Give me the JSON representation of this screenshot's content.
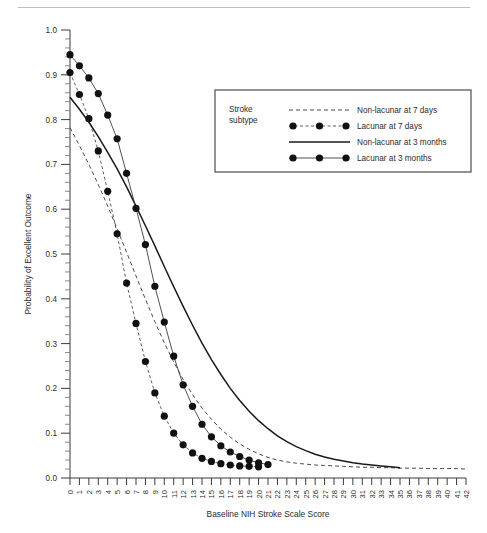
{
  "figure": {
    "background": "#ffffff",
    "rule_color": "#bdbdbd"
  },
  "chart_data": {
    "type": "line",
    "title": "",
    "xlabel": "Baseline NIH Stroke Scale Score",
    "ylabel": "Probability of Excellent Outcome",
    "xlim": [
      0,
      42
    ],
    "ylim": [
      0.0,
      1.0
    ],
    "grid": false,
    "x_tick_labels": [
      "0",
      "1",
      "2",
      "3",
      "4",
      "5",
      "6",
      "7",
      "8",
      "9",
      "10",
      "11",
      "12",
      "13",
      "14",
      "15",
      "16",
      "17",
      "18",
      "19",
      "20",
      "21",
      "22",
      "23",
      "24",
      "25",
      "26",
      "27",
      "28",
      "29",
      "30",
      "31",
      "32",
      "33",
      "34",
      "35",
      "36",
      "37",
      "38",
      "39",
      "40",
      "41",
      "42"
    ],
    "y_tick_labels": [
      "0.0",
      "0.1",
      "0.2",
      "0.3",
      "0.4",
      "0.5",
      "0.6",
      "0.7",
      "0.8",
      "0.9",
      "1.0"
    ],
    "y_minor_per_major": 5,
    "legend": {
      "position": "upper-right-inset",
      "header": "Stroke\nsubtype",
      "header_line1": "Stroke",
      "header_line2": "subtype",
      "entries": [
        {
          "label": "Non-lacunar at 7 days",
          "style": "dashed",
          "markers": false
        },
        {
          "label": "Lacunar at 7 days",
          "style": "dashed",
          "markers": true
        },
        {
          "label": "Non-lacunar at 3 months",
          "style": "solid",
          "markers": false
        },
        {
          "label": "Lacunar at 3 months",
          "style": "solid-thin",
          "markers": true
        }
      ]
    },
    "series": [
      {
        "name": "Non-lacunar at 7 days",
        "style": "dashed",
        "markers": false,
        "x": [
          0,
          1,
          2,
          3,
          4,
          5,
          6,
          7,
          8,
          9,
          10,
          11,
          12,
          13,
          14,
          15,
          16,
          17,
          18,
          19,
          20,
          21,
          22,
          23,
          24,
          25,
          26,
          27,
          28,
          29,
          30,
          31,
          32,
          33,
          34,
          35,
          36,
          37,
          38,
          39,
          40,
          41,
          42
        ],
        "y": [
          0.782,
          0.742,
          0.7,
          0.655,
          0.607,
          0.556,
          0.504,
          0.451,
          0.399,
          0.349,
          0.302,
          0.259,
          0.22,
          0.186,
          0.156,
          0.131,
          0.109,
          0.091,
          0.076,
          0.064,
          0.054,
          0.046,
          0.04,
          0.036,
          0.033,
          0.031,
          0.029,
          0.028,
          0.027,
          0.026,
          0.025,
          0.024,
          0.024,
          0.023,
          0.023,
          0.022,
          0.022,
          0.022,
          0.021,
          0.021,
          0.021,
          0.021,
          0.02
        ]
      },
      {
        "name": "Lacunar at 7 days",
        "style": "dashed",
        "markers": true,
        "x": [
          0,
          1,
          2,
          3,
          4,
          5,
          6,
          7,
          8,
          9,
          10,
          11,
          12,
          13,
          14,
          15,
          16,
          17,
          18,
          19,
          20
        ],
        "y": [
          0.905,
          0.856,
          0.802,
          0.73,
          0.64,
          0.545,
          0.435,
          0.345,
          0.26,
          0.19,
          0.138,
          0.1,
          0.074,
          0.056,
          0.044,
          0.037,
          0.032,
          0.029,
          0.027,
          0.026,
          0.025
        ]
      },
      {
        "name": "Non-lacunar at 3 months",
        "style": "solid",
        "markers": false,
        "x": [
          0,
          1,
          2,
          3,
          4,
          5,
          6,
          7,
          8,
          9,
          10,
          11,
          12,
          13,
          14,
          15,
          16,
          17,
          18,
          19,
          20,
          21,
          22,
          23,
          24,
          25,
          26,
          27,
          28,
          29,
          30,
          31,
          32,
          33,
          34,
          35
        ],
        "y": [
          0.85,
          0.823,
          0.794,
          0.762,
          0.727,
          0.69,
          0.65,
          0.607,
          0.563,
          0.518,
          0.472,
          0.427,
          0.383,
          0.341,
          0.301,
          0.264,
          0.231,
          0.2,
          0.173,
          0.149,
          0.128,
          0.11,
          0.094,
          0.081,
          0.07,
          0.061,
          0.053,
          0.047,
          0.042,
          0.038,
          0.034,
          0.031,
          0.029,
          0.027,
          0.025,
          0.023
        ]
      },
      {
        "name": "Lacunar at 3 months",
        "style": "solid-thin",
        "markers": true,
        "x": [
          0,
          1,
          2,
          3,
          4,
          5,
          6,
          7,
          8,
          9,
          10,
          11,
          12,
          13,
          14,
          15,
          16,
          17,
          18,
          19,
          20,
          21
        ],
        "y": [
          0.945,
          0.92,
          0.893,
          0.858,
          0.81,
          0.757,
          0.68,
          0.602,
          0.521,
          0.428,
          0.348,
          0.272,
          0.208,
          0.16,
          0.12,
          0.092,
          0.072,
          0.058,
          0.048,
          0.04,
          0.034,
          0.03
        ]
      }
    ]
  }
}
